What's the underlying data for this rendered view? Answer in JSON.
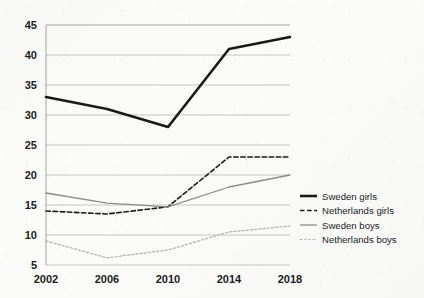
{
  "chart_data": {
    "type": "line",
    "title": "",
    "subtitle": "",
    "xlabel": "",
    "ylabel": "",
    "x": [
      2002,
      2006,
      2010,
      2014,
      2018
    ],
    "categories": [
      "2002",
      "2006",
      "2010",
      "2014",
      "2018"
    ],
    "xtick_labels": [
      "2002",
      "2006",
      "2010",
      "2014",
      "2018"
    ],
    "ytick_labels": [
      "5",
      "10",
      "15",
      "20",
      "25",
      "30",
      "35",
      "40",
      "45"
    ],
    "yticks": [
      5,
      10,
      15,
      20,
      25,
      30,
      35,
      40,
      45
    ],
    "ylim": [
      5,
      45
    ],
    "xlim": [
      2002,
      2018
    ],
    "grid": "horizontal",
    "legend_position": "right",
    "series": [
      {
        "name": "Sweden girls",
        "values": [
          33,
          31,
          28,
          41,
          43
        ],
        "style": "solid",
        "color": "#1a1a1a",
        "width": 2.6
      },
      {
        "name": "Netherlands girls",
        "values": [
          14,
          13.5,
          14.7,
          23,
          23
        ],
        "style": "dashed",
        "color": "#1a1a1a",
        "width": 1.6
      },
      {
        "name": "Sweden boys",
        "values": [
          17,
          15.3,
          14.7,
          18,
          20
        ],
        "style": "solid",
        "color": "#8c8c8c",
        "width": 1.3
      },
      {
        "name": "Netherlands boys",
        "values": [
          9,
          6.2,
          7.5,
          10.5,
          11.5
        ],
        "style": "dotted",
        "color": "#b0b0b0",
        "width": 1.2
      }
    ]
  },
  "legend": {
    "entries": [
      {
        "label": "Sweden girls"
      },
      {
        "label": "Netherlands girls"
      },
      {
        "label": "Sweden boys"
      },
      {
        "label": "Netherlands boys"
      }
    ]
  }
}
